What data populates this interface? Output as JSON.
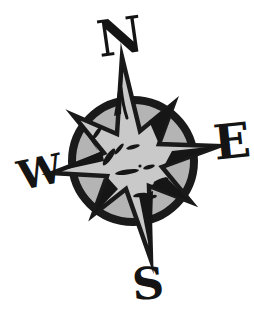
{
  "compass": {
    "labels": {
      "north": "N",
      "east": "E",
      "south": "S",
      "west": "W"
    },
    "colors": {
      "background": "#ffffff",
      "outline": "#1a1a1a",
      "circle_fill": "#b4b4b4",
      "star_fill": "#c9c9c9",
      "letter": "#141414"
    }
  }
}
